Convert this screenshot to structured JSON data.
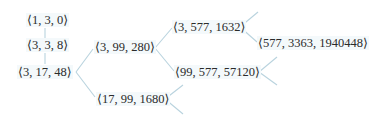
{
  "diagram": {
    "type": "tree",
    "edge_color": "#b9d3de",
    "text_color": "#2b2b2b",
    "nodes": {
      "n1": {
        "label": "⟨1, 3, 0⟩"
      },
      "n2": {
        "label": "⟨3, 3, 8⟩"
      },
      "n3": {
        "label": "⟨3, 17, 48⟩"
      },
      "n4": {
        "label": "⟨3, 99, 280⟩"
      },
      "n5": {
        "label": "⟨17, 99, 1680⟩"
      },
      "n6": {
        "label": "⟨3, 577, 1632⟩"
      },
      "n7": {
        "label": "⟨99, 577, 57120⟩"
      },
      "n8": {
        "label": "⟨577, 3363, 1940448⟩"
      }
    },
    "edges": [
      [
        "n1",
        "n2"
      ],
      [
        "n2",
        "n3"
      ],
      [
        "n3",
        "n4"
      ],
      [
        "n3",
        "n5"
      ],
      [
        "n4",
        "n6"
      ],
      [
        "n4",
        "n7"
      ],
      [
        "n6",
        "n8"
      ]
    ],
    "open_branches": [
      "n6-up",
      "n7-up",
      "n7-down",
      "n5-up",
      "n5-down"
    ]
  }
}
